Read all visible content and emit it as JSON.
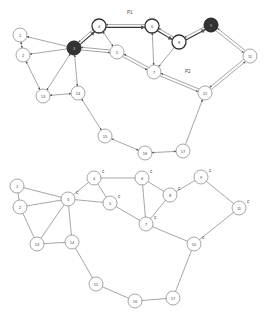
{
  "top_graph": {
    "path_labels": [
      {
        "text": "P1",
        "x": 127,
        "y": 14
      },
      {
        "text": "P2",
        "x": 185,
        "y": 73
      }
    ],
    "nodes": [
      {
        "id": "1",
        "x": 20,
        "y": 35,
        "style": "normal"
      },
      {
        "id": "2",
        "x": 23,
        "y": 55,
        "style": "normal"
      },
      {
        "id": "3",
        "x": 74,
        "y": 48,
        "style": "filled"
      },
      {
        "id": "4",
        "x": 99,
        "y": 26,
        "style": "bold"
      },
      {
        "id": "5",
        "x": 117,
        "y": 52,
        "style": "normal"
      },
      {
        "id": "6",
        "x": 152,
        "y": 26,
        "style": "bold"
      },
      {
        "id": "7",
        "x": 154,
        "y": 72,
        "style": "normal"
      },
      {
        "id": "8",
        "x": 179,
        "y": 42,
        "style": "bold"
      },
      {
        "id": "9",
        "x": 211,
        "y": 25,
        "style": "filled"
      },
      {
        "id": "11",
        "x": 250,
        "y": 56,
        "style": "normal"
      },
      {
        "id": "12",
        "x": 205,
        "y": 93,
        "style": "normal"
      },
      {
        "id": "13",
        "x": 43,
        "y": 96,
        "style": "normal"
      },
      {
        "id": "14",
        "x": 78,
        "y": 93,
        "style": "normal"
      },
      {
        "id": "15",
        "x": 105,
        "y": 136,
        "style": "normal"
      },
      {
        "id": "16",
        "x": 145,
        "y": 153,
        "style": "normal"
      },
      {
        "id": "17",
        "x": 183,
        "y": 151,
        "style": "normal"
      }
    ],
    "edges": [
      {
        "from": "3",
        "to": "1",
        "type": "arrow"
      },
      {
        "from": "3",
        "to": "2",
        "type": "arrow"
      },
      {
        "from": "1",
        "to": "2",
        "type": "bidir"
      },
      {
        "from": "2",
        "to": "13",
        "type": "bidir"
      },
      {
        "from": "3",
        "to": "13",
        "type": "bidir"
      },
      {
        "from": "3",
        "to": "14",
        "type": "bidir"
      },
      {
        "from": "13",
        "to": "14",
        "type": "bidir"
      },
      {
        "from": "3",
        "to": "4",
        "type": "double-bold"
      },
      {
        "from": "3",
        "to": "5",
        "type": "double"
      },
      {
        "from": "4",
        "to": "5",
        "type": "bidir"
      },
      {
        "from": "4",
        "to": "6",
        "type": "double-bold"
      },
      {
        "from": "5",
        "to": "7",
        "type": "double"
      },
      {
        "from": "6",
        "to": "7",
        "type": "bidir"
      },
      {
        "from": "6",
        "to": "8",
        "type": "double-bold"
      },
      {
        "from": "8",
        "to": "7",
        "type": "arrow"
      },
      {
        "from": "8",
        "to": "9",
        "type": "double-bold"
      },
      {
        "from": "9",
        "to": "11",
        "type": "double"
      },
      {
        "from": "7",
        "to": "12",
        "type": "double"
      },
      {
        "from": "12",
        "to": "11",
        "type": "double"
      },
      {
        "from": "14",
        "to": "15",
        "type": "bidir"
      },
      {
        "from": "15",
        "to": "16",
        "type": "bidir"
      },
      {
        "from": "16",
        "to": "17",
        "type": "bidir"
      },
      {
        "from": "17",
        "to": "12",
        "type": "arrow"
      }
    ]
  },
  "bottom_graph": {
    "nodes": [
      {
        "id": "1",
        "x": 17,
        "y": 186,
        "label": ""
      },
      {
        "id": "2",
        "x": 20,
        "y": 207,
        "label": ""
      },
      {
        "id": "3",
        "x": 68,
        "y": 199,
        "label": "c"
      },
      {
        "id": "4",
        "x": 94,
        "y": 178,
        "label": "c"
      },
      {
        "id": "5",
        "x": 110,
        "y": 203,
        "label": "c"
      },
      {
        "id": "6",
        "x": 142,
        "y": 178,
        "label": "c"
      },
      {
        "id": "8",
        "x": 170,
        "y": 195,
        "label": "c"
      },
      {
        "id": "9",
        "x": 201,
        "y": 177,
        "label": "c"
      },
      {
        "id": "7",
        "x": 146,
        "y": 224,
        "label": "c"
      },
      {
        "id": "11",
        "x": 239,
        "y": 208,
        "label": "c"
      },
      {
        "id": "10",
        "x": 194,
        "y": 244,
        "label": "c"
      },
      {
        "id": "13",
        "x": 37,
        "y": 244,
        "label": ""
      },
      {
        "id": "14",
        "x": 72,
        "y": 242,
        "label": ""
      },
      {
        "id": "15",
        "x": 96,
        "y": 284,
        "label": ""
      },
      {
        "id": "16",
        "x": 135,
        "y": 301,
        "label": ""
      },
      {
        "id": "17",
        "x": 173,
        "y": 298,
        "label": ""
      }
    ],
    "edges": [
      [
        "1",
        "2"
      ],
      [
        "1",
        "3"
      ],
      [
        "2",
        "3"
      ],
      [
        "2",
        "13"
      ],
      [
        "3",
        "13"
      ],
      [
        "3",
        "14"
      ],
      [
        "13",
        "14"
      ],
      [
        "3",
        "4"
      ],
      [
        "3",
        "5"
      ],
      [
        "4",
        "5"
      ],
      [
        "4",
        "6"
      ],
      [
        "6",
        "7"
      ],
      [
        "6",
        "8"
      ],
      [
        "8",
        "7"
      ],
      [
        "8",
        "9"
      ],
      [
        "9",
        "11"
      ],
      [
        "11",
        "10"
      ],
      [
        "7",
        "10"
      ],
      [
        "5",
        "7"
      ],
      [
        "14",
        "15"
      ],
      [
        "15",
        "16"
      ],
      [
        "16",
        "17"
      ],
      [
        "17",
        "10"
      ]
    ]
  },
  "colors": {
    "stroke": "#6a6a6a",
    "node_fill": "#ffffff",
    "filled_node": "#333333",
    "bold_stroke": "#333333"
  }
}
